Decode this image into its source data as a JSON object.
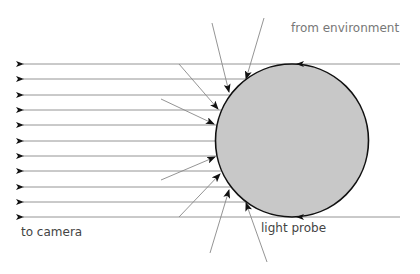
{
  "labels": {
    "from_environment": "from environment",
    "to_camera": "to camera",
    "light_probe": "light probe"
  },
  "diagram": {
    "probe": {
      "cx": 292,
      "cy": 140.5,
      "r": 76.5,
      "fill": "#c8c8c8",
      "stroke": "#111111"
    },
    "ray_color": "#888888",
    "arrow_color": "#111111",
    "horizontal_rays_y": [
      64,
      79,
      95,
      110,
      125,
      141,
      156,
      171,
      187,
      202,
      217
    ],
    "incoming_rays": [
      {
        "x1": 212,
        "y1": 23,
        "x2": 229,
        "y2": 92
      },
      {
        "x1": 264,
        "y1": 18,
        "x2": 246,
        "y2": 79
      },
      {
        "x1": 179,
        "y1": 64,
        "x2": 218,
        "y2": 109
      },
      {
        "x1": 161,
        "y1": 99,
        "x2": 214,
        "y2": 124
      },
      {
        "x1": 161,
        "y1": 180,
        "x2": 215,
        "y2": 157
      },
      {
        "x1": 179,
        "y1": 217,
        "x2": 220,
        "y2": 174
      },
      {
        "x1": 210,
        "y1": 253,
        "x2": 229,
        "y2": 190
      },
      {
        "x1": 267,
        "y1": 262,
        "x2": 246,
        "y2": 203
      }
    ]
  }
}
